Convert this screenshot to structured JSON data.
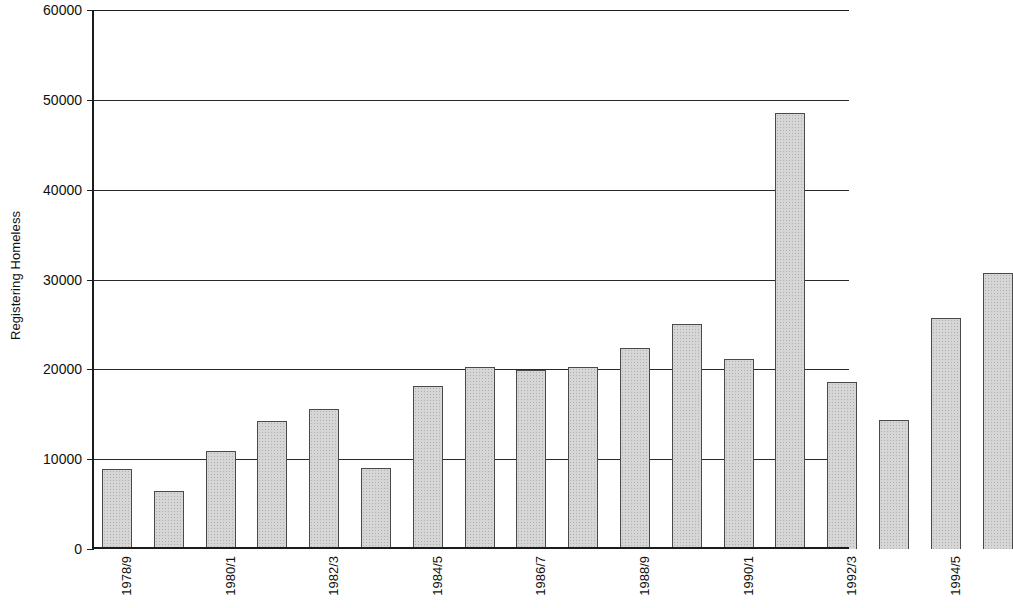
{
  "chart_data": {
    "type": "bar",
    "title": "",
    "xlabel": "",
    "ylabel": "Registering Homeless",
    "ylim": [
      0,
      60000
    ],
    "y_ticks": [
      0,
      10000,
      20000,
      30000,
      40000,
      50000,
      60000
    ],
    "y_tick_labels": [
      "0",
      "10000",
      "20000",
      "30000",
      "40000",
      "50000",
      "60000"
    ],
    "grid": "horizontal",
    "legend": "none",
    "categories": [
      "1978/9",
      "1979/80",
      "1980/1",
      "1981/2",
      "1982/3",
      "1983/4",
      "1984/5",
      "1985/6",
      "1986/7",
      "1987/8",
      "1988/9",
      "1989/90",
      "1990/1",
      "1991/2",
      "1992/3",
      "1993/4",
      "1994/5",
      "1995/6"
    ],
    "x_tick_labels_shown": [
      "1978/9",
      "1980/1",
      "1982/3",
      "1984/5",
      "1986/7",
      "1988/9",
      "1990/1",
      "1992/3",
      "1994/5"
    ],
    "values": [
      8900,
      6500,
      10900,
      14200,
      15600,
      9000,
      18200,
      20300,
      19900,
      20300,
      22400,
      25000,
      21200,
      48500,
      18600,
      14400,
      25700,
      30700
    ],
    "series": [
      {
        "name": "Registering Homeless",
        "values": [
          8900,
          6500,
          10900,
          14200,
          15600,
          9000,
          18200,
          20300,
          19900,
          20300,
          22400,
          25000,
          21200,
          48500,
          18600,
          14400,
          25700,
          30700
        ]
      }
    ],
    "colors": {
      "bar_fill": "#d6d6d6",
      "bar_border": "#4a4a4a",
      "axis": "#1c1c1c",
      "gridline": "#2a2a2a",
      "background": "#ffffff",
      "text": "#101010"
    },
    "note": "Plot area is cropped at the right edge of the image; the final bar is partially visible."
  }
}
